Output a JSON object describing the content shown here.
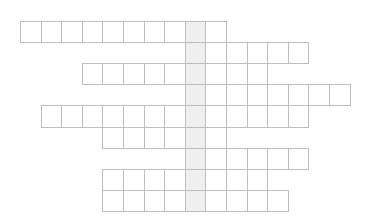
{
  "puzzle": {
    "type": "crossword-grid",
    "origin": {
      "x": 20,
      "y": 21
    },
    "cell_width": 20.6,
    "cell_height": 21.1,
    "highlight_column": 8,
    "colors": {
      "line": "#bdbdbd",
      "cell": "#ffffff",
      "highlight": "#efefef"
    },
    "rows": [
      {
        "start": 0,
        "end": 9
      },
      {
        "start": 8,
        "end": 13
      },
      {
        "start": 3,
        "end": 11
      },
      {
        "start": 8,
        "end": 15
      },
      {
        "start": 1,
        "end": 13
      },
      {
        "start": 4,
        "end": 9
      },
      {
        "start": 8,
        "end": 13
      },
      {
        "start": 4,
        "end": 11
      },
      {
        "start": 4,
        "end": 12
      }
    ]
  }
}
